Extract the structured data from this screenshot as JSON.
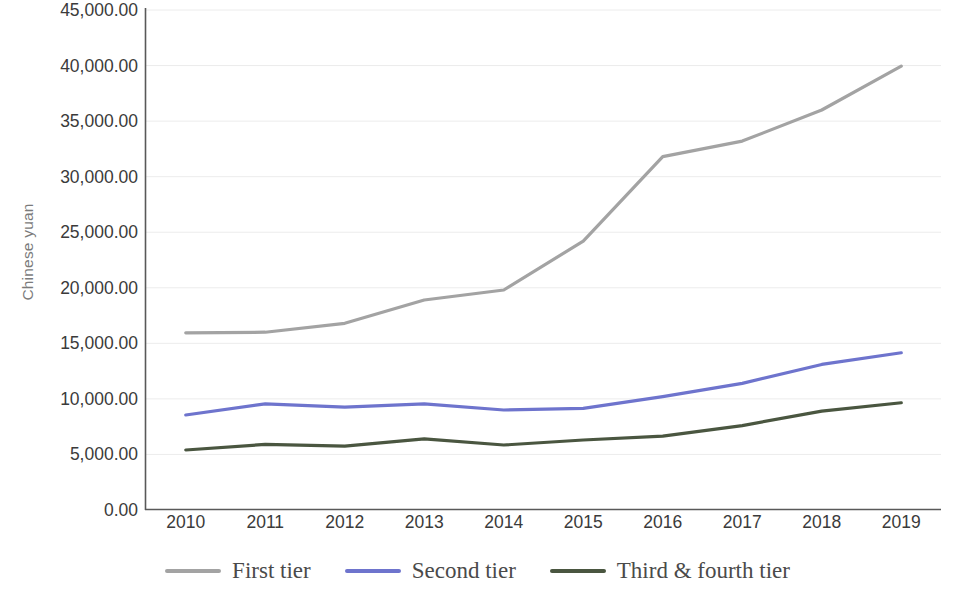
{
  "chart_data": {
    "type": "line",
    "title": "",
    "subtitle": "",
    "xlabel": "",
    "ylabel": "Chinese yuan",
    "categories": [
      "2010",
      "2011",
      "2012",
      "2013",
      "2014",
      "2015",
      "2016",
      "2017",
      "2018",
      "2019"
    ],
    "x": [
      2010,
      2011,
      2012,
      2013,
      2014,
      2015,
      2016,
      2017,
      2018,
      2019
    ],
    "ylim": [
      0,
      45000
    ],
    "ytick_step": 5000,
    "ytick_labels": [
      "45,000.00",
      "40,000.00",
      "35,000.00",
      "30,000.00",
      "25,000.00",
      "20,000.00",
      "15,000.00",
      "10,000.00",
      "5,000.00",
      "0.00"
    ],
    "ytick_values": [
      45000,
      40000,
      35000,
      30000,
      25000,
      20000,
      15000,
      10000,
      5000,
      0
    ],
    "grid": true,
    "grid_axis": "y",
    "legend_position": "bottom",
    "series": [
      {
        "name": "First tier",
        "color": "#a3a3a3",
        "values": [
          15950,
          16000,
          16800,
          18900,
          19800,
          24200,
          31800,
          33200,
          36000,
          39950
        ]
      },
      {
        "name": "Second tier",
        "color": "#6e74cd",
        "values": [
          8550,
          9550,
          9250,
          9550,
          9000,
          9150,
          10200,
          11400,
          13100,
          14150
        ]
      },
      {
        "name": "Third & fourth tier",
        "color": "#4a5640",
        "values": [
          5400,
          5900,
          5750,
          6400,
          5850,
          6300,
          6650,
          7600,
          8900,
          9650
        ]
      }
    ]
  },
  "axis": {
    "y_title": "Chinese yuan"
  },
  "legend": {
    "items": [
      {
        "label": "First tier",
        "color": "#a3a3a3"
      },
      {
        "label": "Second tier",
        "color": "#6e74cd"
      },
      {
        "label": "Third & fourth tier",
        "color": "#4a5640"
      }
    ]
  }
}
